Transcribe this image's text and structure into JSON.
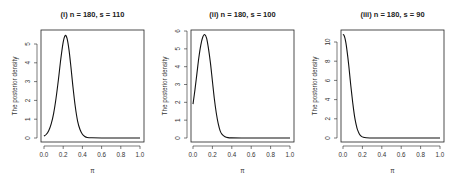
{
  "chart_data": [
    {
      "type": "line",
      "title": "(i) n = 180,  s = 110",
      "xlabel": "π",
      "ylabel": "The posterior density",
      "xlim": [
        0,
        1
      ],
      "ylim": [
        0,
        5.7
      ],
      "xticks": [
        "0.0",
        "0.2",
        "0.4",
        "0.6",
        "0.8",
        "1.0"
      ],
      "yticks": [
        "0",
        "1",
        "2",
        "3",
        "4",
        "5"
      ],
      "grid": false,
      "x": [
        0.0,
        0.025,
        0.05,
        0.075,
        0.1,
        0.125,
        0.15,
        0.175,
        0.2,
        0.22,
        0.24,
        0.26,
        0.28,
        0.3,
        0.325,
        0.35,
        0.375,
        0.4,
        0.425,
        0.45,
        0.5,
        0.6,
        0.7,
        0.8,
        0.9,
        1.0
      ],
      "values": [
        0.1,
        0.2,
        0.4,
        0.75,
        1.3,
        2.1,
        3.1,
        4.2,
        5.1,
        5.45,
        5.3,
        4.7,
        3.8,
        2.8,
        1.7,
        0.9,
        0.45,
        0.2,
        0.08,
        0.03,
        0.01,
        0,
        0,
        0,
        0,
        0
      ]
    },
    {
      "type": "line",
      "title": "(ii) n = 180, s = 100",
      "xlabel": "π",
      "ylabel": "The posterior density",
      "xlim": [
        0,
        1
      ],
      "ylim": [
        0,
        6
      ],
      "xticks": [
        "0.0",
        "0.2",
        "0.4",
        "0.6",
        "0.8",
        "1.0"
      ],
      "yticks": [
        "0",
        "1",
        "2",
        "3",
        "4",
        "5",
        "6"
      ],
      "grid": false,
      "x": [
        0.0,
        0.02,
        0.04,
        0.06,
        0.08,
        0.1,
        0.12,
        0.14,
        0.16,
        0.18,
        0.2,
        0.22,
        0.24,
        0.26,
        0.28,
        0.3,
        0.33,
        0.36,
        0.4,
        0.5,
        0.6,
        0.8,
        1.0
      ],
      "values": [
        1.9,
        2.7,
        3.6,
        4.5,
        5.2,
        5.65,
        5.8,
        5.6,
        5.0,
        4.2,
        3.2,
        2.2,
        1.4,
        0.8,
        0.4,
        0.2,
        0.07,
        0.02,
        0.005,
        0,
        0,
        0,
        0
      ]
    },
    {
      "type": "line",
      "title": "(iii) n = 180, s = 90",
      "xlabel": "π",
      "ylabel": "The posterior density",
      "xlim": [
        0,
        1
      ],
      "ylim": [
        0,
        11
      ],
      "xticks": [
        "0.0",
        "0.2",
        "0.4",
        "0.6",
        "0.8",
        "1.0"
      ],
      "yticks": [
        "0",
        "2",
        "4",
        "6",
        "8",
        "10"
      ],
      "grid": false,
      "x": [
        0.0,
        0.01,
        0.02,
        0.03,
        0.04,
        0.05,
        0.06,
        0.07,
        0.08,
        0.09,
        0.1,
        0.11,
        0.12,
        0.13,
        0.14,
        0.15,
        0.17,
        0.19,
        0.21,
        0.24,
        0.28,
        0.35,
        0.5,
        0.7,
        1.0
      ],
      "values": [
        10.8,
        10.7,
        10.4,
        9.9,
        9.2,
        8.4,
        7.5,
        6.5,
        5.5,
        4.6,
        3.7,
        2.9,
        2.2,
        1.65,
        1.2,
        0.85,
        0.4,
        0.17,
        0.07,
        0.02,
        0.005,
        0,
        0,
        0,
        0
      ]
    }
  ],
  "panels": [
    {
      "title": "(i) n = 180,  s = 110",
      "ylabel": "The posterior density",
      "xlabel": "π"
    },
    {
      "title": "(ii) n = 180, s = 100",
      "ylabel": "The posterior density",
      "xlabel": "π"
    },
    {
      "title": "(iii) n = 180, s = 90",
      "ylabel": "The posterior density",
      "xlabel": "π"
    }
  ]
}
